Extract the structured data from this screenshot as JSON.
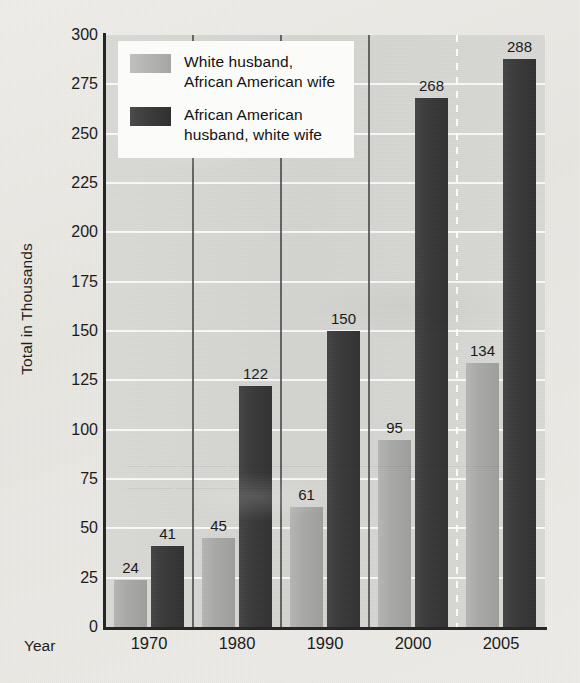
{
  "chart_data": {
    "type": "bar",
    "title": "",
    "subtitle": "",
    "xlabel": "Year",
    "ylabel": "Total in Thousands",
    "categories": [
      "1970",
      "1980",
      "1990",
      "2000",
      "2005"
    ],
    "series": [
      {
        "name": "White husband, African American wife",
        "color": "#a8a8a8",
        "values": [
          24,
          45,
          61,
          95,
          134
        ]
      },
      {
        "name": "African American husband, white wife",
        "color": "#3a3a3a",
        "values": [
          41,
          122,
          150,
          268,
          288
        ]
      }
    ],
    "ylim": [
      0,
      300
    ],
    "ytick_step": 25,
    "yticks": [
      "300",
      "275",
      "250",
      "225",
      "200",
      "175",
      "150",
      "125",
      "100",
      "75",
      "50",
      "25",
      "0"
    ],
    "grid": "horizontal-white-gridlines",
    "legend_position": "top-left",
    "annotations": "Data value printed above every bar. Dashed white vertical divider between the 2000 and 2005 groups; solid dark dividers between other year groups."
  },
  "legend": {
    "entries": [
      {
        "label_line1": "White husband,",
        "label_line2": "African American wife",
        "swatch": "light-gray-swatch"
      },
      {
        "label_line1": "African American",
        "label_line2": "husband, white wife",
        "swatch": "dark-gray-swatch"
      }
    ]
  },
  "axes": {
    "y_title": "Total in Thousands",
    "x_title": "Year"
  },
  "colors": {
    "page_background": "#eceae5",
    "plot_background": "#d5d5d3",
    "gridline": "#ffffff",
    "axis_line": "#262626",
    "series_light": "#a8a8a8",
    "series_dark": "#3a3a3a",
    "legend_background": "#fbfbfa",
    "text": "#1b1b1b"
  },
  "watermark": {
    "note": "faint illegible bleed-through text from the reverse page"
  }
}
